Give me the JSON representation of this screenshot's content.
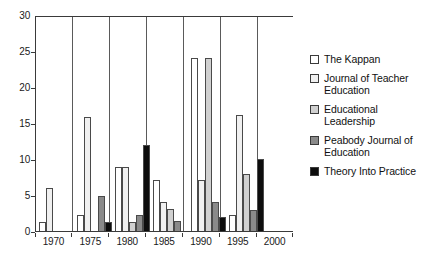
{
  "chart_data": {
    "type": "bar",
    "title": "",
    "subtitle": "",
    "xlabel": "",
    "ylabel": "",
    "categories": [
      "1970",
      "1975",
      "1980",
      "1985",
      "1990",
      "1995",
      "2000"
    ],
    "xlim": [
      "1970",
      "2000"
    ],
    "ylim": [
      0,
      30
    ],
    "y_ticks": [
      0,
      5,
      10,
      15,
      20,
      25,
      30
    ],
    "x_ticks": [
      "1970",
      "1975",
      "1980",
      "1985",
      "1990",
      "1995",
      "2000"
    ],
    "grid": "vertical-only",
    "legend_position": "right",
    "series": [
      {
        "name": "The Kappan",
        "color": "#ffffff",
        "values": [
          1.3,
          2.3,
          9.0,
          7.2,
          24.3,
          2.3,
          0
        ]
      },
      {
        "name": "Journal of Teacher Education",
        "color": "#f0f0f0",
        "values": [
          6.0,
          16.0,
          9.0,
          4.0,
          7.2,
          16.2,
          0
        ]
      },
      {
        "name": "Educational Leadership",
        "color": "#d0d0d0",
        "values": [
          0,
          0,
          1.2,
          3.1,
          24.2,
          8.0,
          0
        ]
      },
      {
        "name": "Peabody Journal of Education",
        "color": "#8a8a8a",
        "values": [
          0,
          4.9,
          2.2,
          1.4,
          4.0,
          3.0,
          0
        ]
      },
      {
        "name": "Theory Into Practice",
        "color": "#0d0d0d",
        "values": [
          0,
          1.3,
          12.0,
          0,
          2.0,
          10.1,
          0
        ]
      }
    ]
  },
  "legend": {
    "items": [
      {
        "label": "The Kappan"
      },
      {
        "label": "Journal of Teacher Education"
      },
      {
        "label": "Educational Leadership"
      },
      {
        "label": "Peabody Journal of Education"
      },
      {
        "label": "Theory Into Practice"
      }
    ]
  }
}
